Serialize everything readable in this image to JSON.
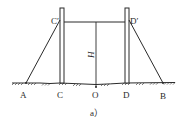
{
  "diagram": {
    "caption": "a）",
    "labels": {
      "A": "A",
      "B": "B",
      "C": "C",
      "D": "D",
      "O": "O",
      "C_prime": "C′",
      "D_prime": "D′",
      "H": "H"
    },
    "colors": {
      "stroke": "#2a2a2a",
      "background": "#ffffff"
    }
  }
}
